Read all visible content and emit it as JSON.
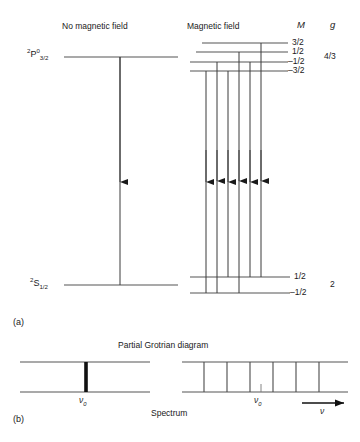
{
  "figure": {
    "panel_a_label": "(a)",
    "panel_b_label": "(b)",
    "grotrian_title": "Partial Grotrian diagram",
    "spectrum_title": "Spectrum"
  },
  "left_panel": {
    "heading": "No magnetic field",
    "upper_term": {
      "multiplicity": "2",
      "letter": "P",
      "parity": "0",
      "j": "3/2"
    },
    "lower_term": {
      "multiplicity": "2",
      "letter": "S",
      "parity": "",
      "j": "1/2"
    },
    "transitions": 1
  },
  "right_panel": {
    "heading": "Magnetic field",
    "column_M": "M",
    "column_g": "g",
    "upper_levels": [
      {
        "M": "3/2"
      },
      {
        "M": "1/2"
      },
      {
        "M": "–1/2"
      },
      {
        "M": "–3/2"
      }
    ],
    "upper_g": "4/3",
    "lower_levels": [
      {
        "M": "1/2"
      },
      {
        "M": "–1/2"
      }
    ],
    "lower_g": "2",
    "transitions": 6
  },
  "spectrum": {
    "left": {
      "center_label": "ν",
      "center_sub": "0",
      "line_count": 1
    },
    "right": {
      "center_label": "ν",
      "center_sub": "0",
      "line_count": 6,
      "axis_label": "ν"
    }
  },
  "colors": {
    "ink": "#1a1a1a",
    "line": "#4a4a4a",
    "level": "#555555",
    "background": "#ffffff"
  }
}
